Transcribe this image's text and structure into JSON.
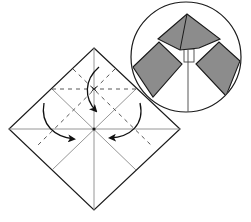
{
  "diagram": {
    "title": "Origami fold step: fold the three corner flaps inward toward center",
    "colors": {
      "outline": "#1a1a1a",
      "crease": "#8a8a8a",
      "valley_fold": "#444444",
      "paper_colored": "#8c8c8c",
      "paper_white": "#ffffff",
      "arrow": "#111111"
    },
    "main_square": {
      "shape": "diamond",
      "vertices": {
        "top": [
          94,
          48
        ],
        "right": [
          180,
          129
        ],
        "bottom": [
          94,
          210
        ],
        "left": [
          9,
          129
        ]
      },
      "center": [
        94,
        129
      ]
    },
    "creases": [
      {
        "id": "vertical",
        "from": [
          94,
          48
        ],
        "to": [
          94,
          210
        ],
        "style": "solid"
      },
      {
        "id": "horizontal",
        "from": [
          9,
          129
        ],
        "to": [
          180,
          129
        ],
        "style": "solid"
      },
      {
        "id": "diag-a",
        "from": [
          52,
          89
        ],
        "to": [
          136,
          170
        ],
        "style": "solid"
      },
      {
        "id": "diag-b",
        "from": [
          136,
          89
        ],
        "to": [
          52,
          170
        ],
        "style": "solid"
      }
    ],
    "fold_lines": [
      {
        "id": "valley-horizontal",
        "from": [
          52,
          89
        ],
        "to": [
          136,
          89
        ],
        "style": "dashed"
      },
      {
        "id": "valley-diag-left",
        "from": [
          115,
          69
        ],
        "to": [
          36,
          147
        ],
        "style": "dashed"
      },
      {
        "id": "valley-diag-right",
        "from": [
          73,
          69
        ],
        "to": [
          153,
          147
        ],
        "style": "dashed"
      }
    ],
    "markers": [
      {
        "id": "cross-mark",
        "at": [
          94,
          89
        ],
        "symbol": "x"
      }
    ],
    "arrows": [
      {
        "id": "arrow-top",
        "direction": "down",
        "path": "M99 67 C 84 80, 84 98, 96 111"
      },
      {
        "id": "arrow-left",
        "direction": "down-right",
        "path": "M44 103 C 40 125, 55 137, 74 139"
      },
      {
        "id": "arrow-right",
        "direction": "down-left",
        "path": "M140 103 C 145 125, 130 137, 110 138"
      }
    ],
    "detail_view": {
      "shape": "circle",
      "center": [
        186,
        57
      ],
      "radius": 55,
      "label": "Result preview",
      "shapes": {
        "top_flap": {
          "points": [
            [
              187,
              14
            ],
            [
              220,
              39
            ],
            [
              199,
              48
            ],
            [
              180,
              50
            ],
            [
              158,
              39
            ]
          ],
          "crease_from": [
            187,
            14
          ],
          "crease_to": [
            180,
            50
          ]
        },
        "left_flap": {
          "points": [
            [
              133,
              67
            ],
            [
              159,
              42
            ],
            [
              182,
              64
            ],
            [
              153,
              97
            ]
          ]
        },
        "right_flap": {
          "points": [
            [
              196,
              64
            ],
            [
              219,
              42
            ],
            [
              240,
              61
            ],
            [
              226,
              96
            ]
          ]
        },
        "center_line": {
          "from": [
            188,
            50
          ],
          "to": [
            188,
            112
          ]
        },
        "center_slot": {
          "x": 184,
          "y": 49,
          "w": 10,
          "h": 13
        }
      }
    }
  }
}
